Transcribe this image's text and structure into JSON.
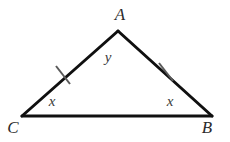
{
  "figure": {
    "background_color": "#ffffff",
    "stroke_color": "#101010",
    "tick_color": "#5a5a5a",
    "stroke_width": 3,
    "tick_width": 2,
    "vertices": [
      {
        "name": "A",
        "label": "A",
        "x": 118,
        "y": 31,
        "label_x": 120,
        "label_y": 14
      },
      {
        "name": "B",
        "label": "B",
        "x": 212,
        "y": 116,
        "label_x": 207,
        "label_y": 127
      },
      {
        "name": "C",
        "label": "C",
        "x": 22,
        "y": 116,
        "label_x": 13,
        "label_y": 127
      }
    ],
    "sides": [
      {
        "name": "side-CA",
        "from": "C",
        "to": "A",
        "tick_marks": 1
      },
      {
        "name": "side-AB",
        "from": "A",
        "to": "B",
        "tick_marks": 1
      },
      {
        "name": "side-CB",
        "from": "C",
        "to": "B",
        "tick_marks": 0
      }
    ],
    "tick_marks": [
      {
        "name": "tick-side-CA",
        "cx": 63,
        "cy": 75,
        "angle_deg": 50,
        "length": 22
      },
      {
        "name": "tick-side-AB",
        "cx": 166,
        "cy": 72,
        "angle_deg": -48,
        "length": 22
      }
    ],
    "angle_labels": [
      {
        "name": "angle-label-apex",
        "label": "y",
        "x": 108,
        "y": 57
      },
      {
        "name": "angle-label-left-base",
        "label": "x",
        "x": 52,
        "y": 101
      },
      {
        "name": "angle-label-right-base",
        "label": "x",
        "x": 170,
        "y": 101
      }
    ]
  }
}
